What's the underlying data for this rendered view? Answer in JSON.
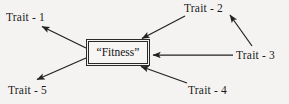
{
  "diagram": {
    "type": "node-arrow-diagram",
    "background_color": "#f4f3f1",
    "stroke_color": "#222222",
    "center_node": {
      "label": "“Fitness”",
      "shape": "rectangle",
      "border_style": "double-line",
      "x": 88,
      "y": 41,
      "width": 60,
      "height": 23
    },
    "nodes": [
      {
        "id": "trait-1",
        "label": "Trait - 1",
        "position": "top-left",
        "x": 6,
        "y": 12
      },
      {
        "id": "trait-2",
        "label": "Trait - 2",
        "position": "top-right",
        "x": 184,
        "y": 3
      },
      {
        "id": "trait-3",
        "label": "Trait - 3",
        "position": "right",
        "x": 236,
        "y": 50
      },
      {
        "id": "trait-4",
        "label": "Trait - 4",
        "position": "bottom-right",
        "x": 188,
        "y": 85
      },
      {
        "id": "trait-5",
        "label": "Trait - 5",
        "position": "bottom-left",
        "x": 8,
        "y": 85
      }
    ],
    "arrows": [
      {
        "id": "arrow-fitness-to-trait-1",
        "from": "fitness",
        "to": "trait-1",
        "direction": "outgoing",
        "x1": 86,
        "y1": 48,
        "x2": 41,
        "y2": 26
      },
      {
        "id": "arrow-fitness-to-trait-5",
        "from": "fitness",
        "to": "trait-5",
        "direction": "outgoing",
        "x1": 86,
        "y1": 58,
        "x2": 36,
        "y2": 80
      },
      {
        "id": "arrow-trait-2-to-fitness",
        "from": "trait-2",
        "to": "fitness",
        "direction": "incoming",
        "x1": 185,
        "y1": 16,
        "x2": 141,
        "y2": 39
      },
      {
        "id": "arrow-trait-3-to-fitness",
        "from": "trait-3",
        "to": "fitness",
        "direction": "incoming",
        "x1": 233,
        "y1": 55,
        "x2": 152,
        "y2": 55
      },
      {
        "id": "arrow-trait-4-to-fitness",
        "from": "trait-4",
        "to": "fitness",
        "direction": "incoming",
        "x1": 187,
        "y1": 83,
        "x2": 140,
        "y2": 66
      },
      {
        "id": "arrow-trait-3-to-trait-2",
        "from": "trait-3",
        "to": "trait-2",
        "direction": "outgoing",
        "x1": 252,
        "y1": 46,
        "x2": 229,
        "y2": 14
      }
    ]
  }
}
